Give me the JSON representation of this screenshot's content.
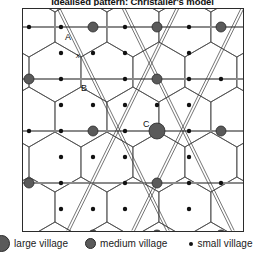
{
  "title": "Idealised pattern: Christaller's model",
  "map": {
    "frame": {
      "x": 22,
      "y": 8,
      "width": 222,
      "height": 224
    },
    "labels": [
      {
        "id": "A",
        "text": "A",
        "x": 64,
        "y": 36,
        "note": "small village at hexagon centre"
      },
      {
        "id": "x",
        "text": "x",
        "x": 75,
        "y": 54,
        "note": "distance marker point"
      },
      {
        "id": "B",
        "text": "B",
        "x": 80,
        "y": 85,
        "note": "medium village"
      },
      {
        "id": "C",
        "text": "C",
        "x": 140,
        "y": 122,
        "note": "large village"
      }
    ],
    "colors": {
      "large_village_fill": "#5a5a5a",
      "medium_village_fill": "#5a5a5a",
      "small_village_fill": "#111111",
      "marker_stroke": "#2a2a2a",
      "hex_line": "#444444",
      "route_line": "#777777",
      "frame_border": "#2b2b2b"
    },
    "settlement_counts": {
      "large_village": 1,
      "medium_village": 12,
      "small_village": 46
    }
  },
  "chart_data": {
    "type": "scatter",
    "title": "Idealised pattern: Christaller's model",
    "xlabel": "",
    "ylabel": "",
    "legend_position": "bottom",
    "series": [
      {
        "name": "large village",
        "marker": "large-filled-circle",
        "radius": 8,
        "color": "#5a5a5a",
        "points": [
          [
            134,
            122
          ]
        ]
      },
      {
        "name": "medium village",
        "marker": "medium-filled-circle",
        "radius": 5,
        "color": "#5a5a5a",
        "points": [
          [
            70,
            18
          ],
          [
            70,
            122
          ],
          [
            70,
            226
          ],
          [
            134,
            18
          ],
          [
            134,
            70
          ],
          [
            134,
            174
          ],
          [
            134,
            226
          ],
          [
            198,
            18
          ],
          [
            198,
            122
          ],
          [
            198,
            226
          ],
          [
            6,
            70
          ],
          [
            6,
            174
          ]
        ]
      },
      {
        "name": "small village",
        "marker": "small-filled-dot",
        "radius": 2.2,
        "color": "#111111",
        "points": [
          [
            38,
            44
          ],
          [
            38,
            96
          ],
          [
            38,
            148
          ],
          [
            38,
            200
          ],
          [
            102,
            44
          ],
          [
            102,
            96
          ],
          [
            102,
            148
          ],
          [
            102,
            200
          ],
          [
            166,
            44
          ],
          [
            166,
            96
          ],
          [
            166,
            148
          ],
          [
            166,
            200
          ],
          [
            230,
            44
          ],
          [
            230,
            96
          ],
          [
            230,
            148
          ],
          [
            230,
            200
          ],
          [
            6,
            18
          ],
          [
            6,
            122
          ],
          [
            6,
            226
          ],
          [
            102,
            18
          ],
          [
            102,
            70
          ],
          [
            102,
            122
          ],
          [
            102,
            174
          ],
          [
            102,
            226
          ],
          [
            166,
            18
          ],
          [
            166,
            70
          ],
          [
            166,
            122
          ],
          [
            166,
            174
          ],
          [
            166,
            226
          ],
          [
            230,
            18
          ],
          [
            230,
            70
          ],
          [
            230,
            122
          ],
          [
            230,
            174
          ],
          [
            230,
            226
          ],
          [
            38,
            18
          ],
          [
            38,
            70
          ],
          [
            38,
            122
          ],
          [
            38,
            174
          ],
          [
            38,
            226
          ],
          [
            70,
            44
          ],
          [
            70,
            96
          ],
          [
            70,
            148
          ],
          [
            70,
            200
          ],
          [
            134,
            96
          ],
          [
            198,
            70
          ],
          [
            198,
            174
          ]
        ]
      }
    ]
  },
  "legend": {
    "items": [
      {
        "id": "large",
        "label": "large village",
        "marker": "large-circle-icon"
      },
      {
        "id": "medium",
        "label": "medium village",
        "marker": "medium-circle-icon"
      },
      {
        "id": "small",
        "label": "small village",
        "marker": "small-dot-icon"
      }
    ]
  }
}
